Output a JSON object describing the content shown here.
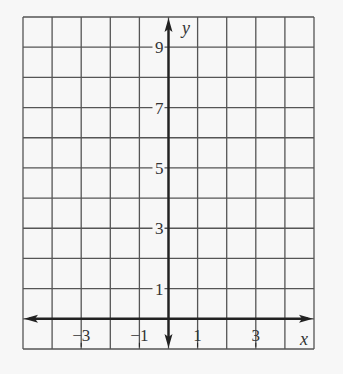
{
  "chart_data": {
    "type": "line",
    "title": "",
    "xlabel": "x",
    "ylabel": "y",
    "xlim": [
      -5,
      5
    ],
    "ylim": [
      -1,
      10
    ],
    "grid": true,
    "grid_step": 1,
    "x_tick_labels": [
      {
        "value": -3,
        "label": "−3"
      },
      {
        "value": -1,
        "label": "−1"
      },
      {
        "value": 1,
        "label": "1"
      },
      {
        "value": 3,
        "label": "3"
      }
    ],
    "y_tick_labels": [
      {
        "value": 1,
        "label": "1"
      },
      {
        "value": 3,
        "label": "3"
      },
      {
        "value": 5,
        "label": "5"
      },
      {
        "value": 7,
        "label": "7"
      },
      {
        "value": 9,
        "label": "9"
      }
    ],
    "series": [],
    "colors": {
      "grid": "#555555",
      "axis": "#222222",
      "background": "#f7f7f7"
    }
  }
}
